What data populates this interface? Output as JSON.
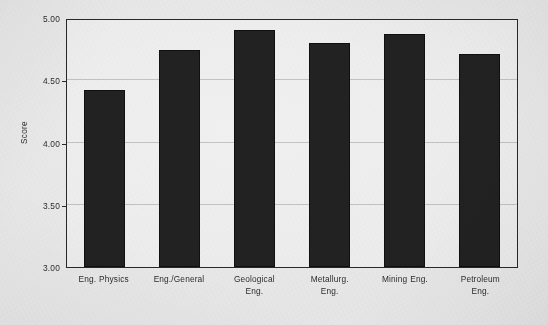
{
  "chart_data": {
    "type": "bar",
    "title": "",
    "xlabel": "",
    "ylabel": "Score",
    "ylim": [
      3.0,
      5.0
    ],
    "yticks": [
      "3.00",
      "3.50",
      "4.00",
      "4.50",
      "5.00"
    ],
    "ytick_values": [
      3.0,
      3.5,
      4.0,
      4.5,
      5.0
    ],
    "grid": true,
    "legend": "none",
    "bar_color": "#232323",
    "plot_background": "#f7f7f7",
    "categories": [
      "Eng. Physics",
      "Eng./General",
      "Geological Eng.",
      "Metallurg. Eng.",
      "Mining Eng.",
      "Petroleum Eng."
    ],
    "category_lines": [
      [
        "Eng. Physics"
      ],
      [
        "Eng./General"
      ],
      [
        "Geological",
        "Eng."
      ],
      [
        "Metallurg.",
        "Eng."
      ],
      [
        "Mining Eng."
      ],
      [
        "Petroleum",
        "Eng."
      ]
    ],
    "values": [
      4.42,
      4.74,
      4.9,
      4.8,
      4.87,
      4.71
    ],
    "bars": [
      {
        "label": "Eng. Physics",
        "value": 4.42,
        "pct_of_axis": 71.0
      },
      {
        "label": "Eng./General",
        "value": 4.74,
        "pct_of_axis": 87.0
      },
      {
        "label": "Geological Eng.",
        "value": 4.9,
        "pct_of_axis": 95.2
      },
      {
        "label": "Metallurg. Eng.",
        "value": 4.8,
        "pct_of_axis": 90.0
      },
      {
        "label": "Mining Eng.",
        "value": 4.87,
        "pct_of_axis": 93.6
      },
      {
        "label": "Petroleum Eng.",
        "value": 4.71,
        "pct_of_axis": 85.5
      }
    ]
  }
}
